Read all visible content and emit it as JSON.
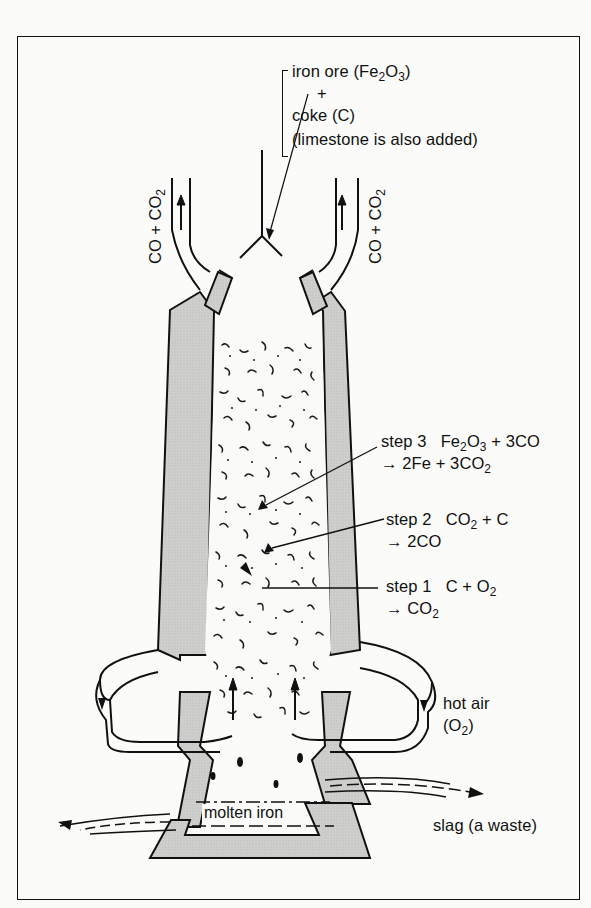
{
  "figure": {
    "partial_heading": "g"
  },
  "inputs": {
    "line1": "iron ore (Fe",
    "line1_sub1": "2",
    "line1_mid": "O",
    "line1_sub2": "3",
    "line1_end": ")",
    "plus": "+",
    "line3": "coke (C)",
    "line4": "(limestone is also added)"
  },
  "exhaust": {
    "left": {
      "pre": "CO + CO",
      "sub": "2"
    },
    "right": {
      "pre": "CO + CO",
      "sub": "2"
    }
  },
  "steps": [
    {
      "name": "step 3",
      "reactants": [
        {
          "t": "Fe"
        },
        {
          "s": "2"
        },
        {
          "t": "O"
        },
        {
          "s": "3"
        },
        {
          "t": " + 3CO"
        }
      ],
      "products": [
        {
          "t": "→ 2Fe + 3CO"
        },
        {
          "s": "2"
        }
      ]
    },
    {
      "name": "step 2",
      "reactants": [
        {
          "t": "CO"
        },
        {
          "s": "2"
        },
        {
          "t": " + C"
        }
      ],
      "products": [
        {
          "t": "→ 2CO"
        }
      ]
    },
    {
      "name": "step 1",
      "reactants": [
        {
          "t": "C + O"
        },
        {
          "s": "2"
        }
      ],
      "products": [
        {
          "t": "→ CO"
        },
        {
          "s": "2"
        }
      ]
    }
  ],
  "hot_air": {
    "line1": "hot air",
    "line2_pre": "(O",
    "line2_sub": "2",
    "line2_end": ")"
  },
  "molten_iron": "molten iron",
  "slag": "slag (a waste)",
  "colors": {
    "wall": "#c9c9c7",
    "stroke": "#111111",
    "background": "#fbfbf9"
  }
}
